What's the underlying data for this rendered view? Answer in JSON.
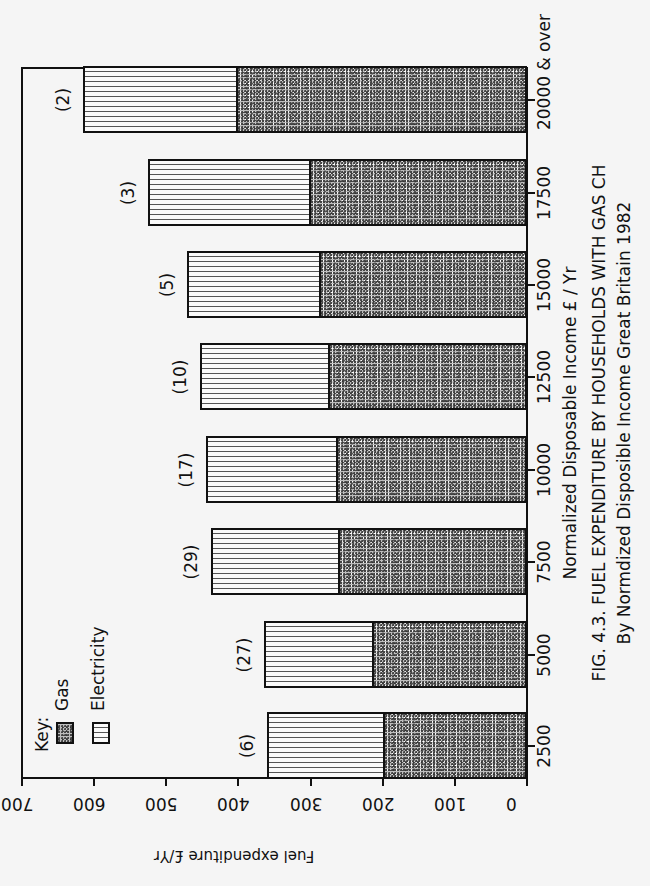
{
  "figure": {
    "caption_line1": "FIG. 4.3. FUEL EXPENDITURE  BY HOUSEHOLDS WITH GAS CH",
    "caption_line2": "By Normdized  Disposible Income   Great  Britain 1982",
    "orientation": "rotated 90° counter-clockwise on page"
  },
  "axes": {
    "ylabel": "Fuel expenditure £/Yr",
    "xlabel": "Normalized  Disposable Income  £ / Yr",
    "yticks": [
      "0",
      "100",
      "200",
      "300",
      "400",
      "500",
      "600",
      "700"
    ],
    "xticks": [
      "2500",
      "5000",
      "7500",
      "10000",
      "12500",
      "15000",
      "17500",
      "20000 & over"
    ]
  },
  "legend": {
    "title": "Key:",
    "items": [
      {
        "label": "Gas",
        "pattern": "stipple"
      },
      {
        "label": "Electricity",
        "pattern": "dashed-vertical-hatch"
      }
    ]
  },
  "counts": [
    "(6)",
    "(27)",
    "(29)",
    "(17)",
    "(10)",
    "(5)",
    "(3)",
    "(2)"
  ],
  "chart_data": {
    "type": "bar",
    "stacked": true,
    "xlabel": "Normalized Disposable Income £ / Yr",
    "ylabel": "Fuel expenditure £/Yr",
    "ylim": [
      0,
      700
    ],
    "yticks": [
      0,
      100,
      200,
      300,
      400,
      500,
      600,
      700
    ],
    "grid": false,
    "legend_position": "upper-left (Key)",
    "categories": [
      "2500",
      "5000",
      "7500",
      "10000",
      "12500",
      "15000",
      "17500",
      "20000 & over"
    ],
    "series": [
      {
        "name": "Gas",
        "values": [
          200,
          215,
          262,
          265,
          276,
          289,
          302,
          404
        ]
      },
      {
        "name": "Electricity",
        "values": [
          160,
          150,
          176,
          180,
          177,
          182,
          223,
          211
        ]
      }
    ],
    "totals": [
      360,
      365,
      438,
      445,
      453,
      471,
      525,
      615
    ],
    "sample_counts": [
      6,
      27,
      29,
      17,
      10,
      5,
      3,
      2
    ]
  }
}
